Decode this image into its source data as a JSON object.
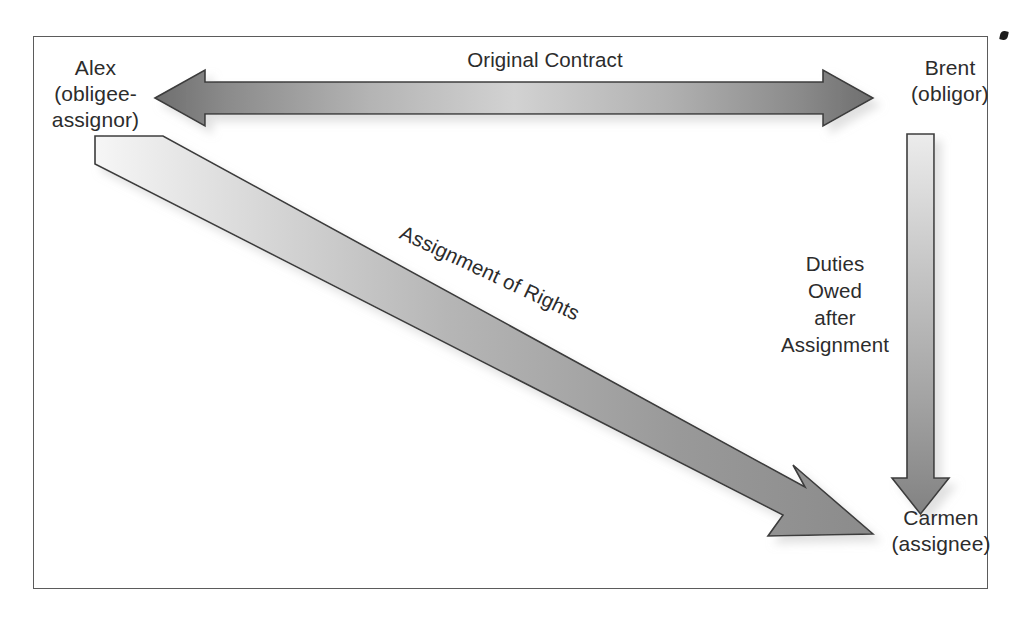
{
  "figure": {
    "type": "diagram",
    "subject": "Contract assignment of rights",
    "background_color": "#ffffff",
    "frame_color": "#5b5b5b",
    "text_color": "#2c2c2c"
  },
  "nodes": [
    {
      "id": "alex",
      "lines": "Alex\n(obligee-\nassignor)",
      "name": "Alex",
      "role": "obligee-assignor"
    },
    {
      "id": "brent",
      "lines": "Brent\n(obligor)",
      "name": "Brent",
      "role": "obligor"
    },
    {
      "id": "carmen",
      "lines": "Carmen\n(assignee)",
      "name": "Carmen",
      "role": "assignee"
    }
  ],
  "arrows": [
    {
      "id": "original-contract",
      "label": "Original Contract",
      "direction": "bidirectional",
      "from": "alex",
      "to": "brent",
      "orientation": "horizontal",
      "fill_light": "#c9c9c9",
      "fill_dark": "#6e6e6e"
    },
    {
      "id": "assignment-of-rights",
      "label": "Assignment of Rights",
      "direction": "one-way",
      "from": "alex",
      "to": "carmen",
      "orientation": "diagonal",
      "rotation_deg": 25.2,
      "fill_light": "#ededed",
      "fill_dark": "#8e8e8e"
    },
    {
      "id": "duties-owed",
      "label": "Duties\nOwed\nafter\nAssignment",
      "direction": "one-way",
      "from": "brent",
      "to": "carmen",
      "orientation": "vertical",
      "fill_light": "#e4e4e4",
      "fill_dark": "#8b8b8b"
    }
  ]
}
